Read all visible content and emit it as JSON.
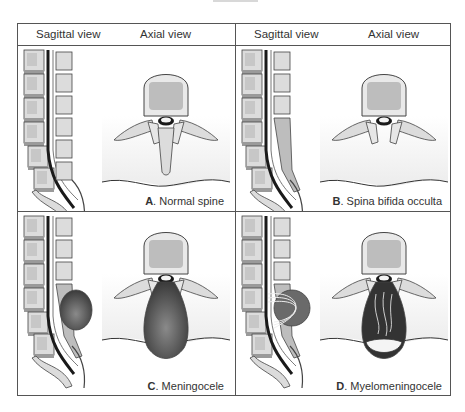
{
  "header": {
    "left": {
      "sagittal": "Sagittal view",
      "axial": "Axial view"
    },
    "right": {
      "sagittal": "Sagittal view",
      "axial": "Axial view"
    }
  },
  "panels": [
    {
      "letter": "A",
      "label": ". Normal spine",
      "condition": "normal"
    },
    {
      "letter": "B",
      "label": ". Spina bifida occulta",
      "condition": "spina-bifida-occulta"
    },
    {
      "letter": "C",
      "label": ". Meningocele",
      "condition": "meningocele"
    },
    {
      "letter": "D",
      "label": ". Myelomeningocele",
      "condition": "myelomeningocele"
    }
  ],
  "colors": {
    "bone": "#dcdcdc",
    "bone_inner": "#bdbdbd",
    "outline": "#444444",
    "sac": "#555555",
    "cord": "#1a1a1a",
    "tissue": "#f2f2f2"
  }
}
